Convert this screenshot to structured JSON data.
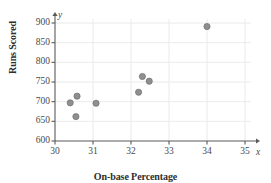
{
  "chart_data": {
    "type": "scatter",
    "title": "",
    "xlabel": "On-base Percentage",
    "ylabel": "Runs Scored",
    "x_axis_variable": "x",
    "y_axis_variable": "y",
    "xlim": [
      30,
      35
    ],
    "ylim": [
      600,
      900
    ],
    "xticks": [
      30,
      31,
      32,
      33,
      34,
      35
    ],
    "yticks": [
      600,
      650,
      700,
      750,
      800,
      850,
      900
    ],
    "grid": true,
    "legend": "none",
    "marker_color": "#8a8a8a",
    "points": [
      {
        "x": 30.4,
        "y": 697
      },
      {
        "x": 30.58,
        "y": 714
      },
      {
        "x": 30.55,
        "y": 662
      },
      {
        "x": 31.08,
        "y": 696
      },
      {
        "x": 32.2,
        "y": 724
      },
      {
        "x": 32.3,
        "y": 764
      },
      {
        "x": 32.48,
        "y": 752
      },
      {
        "x": 34.0,
        "y": 891
      }
    ]
  },
  "axis": {
    "x_tick_labels": [
      "30",
      "31",
      "32",
      "33",
      "34",
      "35"
    ],
    "y_tick_labels": [
      "600",
      "650",
      "700",
      "750",
      "800",
      "850",
      "900"
    ],
    "x_variable_label": "x",
    "y_variable_label": "y",
    "x_title": "On-base Percentage",
    "y_title": "Runs Scored"
  },
  "style": {
    "grid_color": "#eceaea",
    "axis_color": "#5a5a5a",
    "marker_color": "#8f8f8f",
    "marker_edge_color": "#6f6f6f"
  }
}
